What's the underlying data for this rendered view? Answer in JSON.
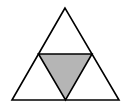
{
  "diagram": {
    "type": "sierpinski-triangle-subdivision",
    "colors": {
      "background": "#ffffff",
      "stroke": "#000000",
      "shaded_fill": "#b5b5b5",
      "unshaded_fill": "#ffffff"
    },
    "outer_triangle": {
      "apex": [
        65,
        8
      ],
      "bottom_left": [
        12,
        100
      ],
      "bottom_right": [
        119,
        100
      ]
    },
    "midpoints": {
      "left": [
        38.5,
        54
      ],
      "right": [
        92,
        54
      ],
      "bottom": [
        65.5,
        100
      ]
    },
    "sub_triangles": [
      {
        "name": "top",
        "shaded": false
      },
      {
        "name": "bottom-left",
        "shaded": false
      },
      {
        "name": "bottom-right",
        "shaded": false
      },
      {
        "name": "center-inverted",
        "shaded": true
      }
    ]
  }
}
